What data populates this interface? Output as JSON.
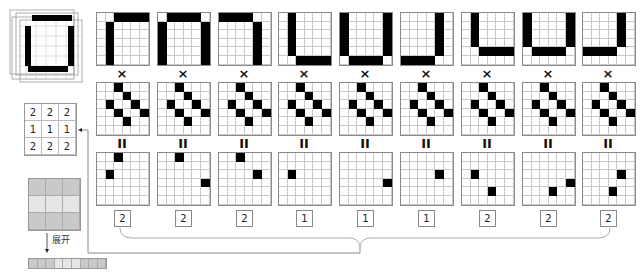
{
  "operators": {
    "multiply": "×",
    "equals": "II"
  },
  "images": [
    {
      "on": [
        [
          0,
          2
        ],
        [
          0,
          3
        ],
        [
          0,
          4
        ],
        [
          0,
          5
        ],
        [
          1,
          1
        ],
        [
          2,
          1
        ],
        [
          3,
          1
        ],
        [
          4,
          1
        ],
        [
          5,
          1
        ]
      ]
    },
    {
      "on": [
        [
          0,
          1
        ],
        [
          0,
          2
        ],
        [
          0,
          3
        ],
        [
          0,
          4
        ],
        [
          1,
          0
        ],
        [
          2,
          0
        ],
        [
          3,
          0
        ],
        [
          4,
          0
        ],
        [
          5,
          0
        ],
        [
          1,
          5
        ],
        [
          2,
          5
        ],
        [
          3,
          5
        ],
        [
          4,
          5
        ],
        [
          5,
          5
        ]
      ]
    },
    {
      "on": [
        [
          0,
          0
        ],
        [
          0,
          1
        ],
        [
          0,
          2
        ],
        [
          0,
          3
        ],
        [
          1,
          4
        ],
        [
          2,
          4
        ],
        [
          3,
          4
        ],
        [
          4,
          4
        ],
        [
          5,
          4
        ]
      ]
    },
    {
      "on": [
        [
          0,
          1
        ],
        [
          1,
          1
        ],
        [
          2,
          1
        ],
        [
          3,
          1
        ],
        [
          4,
          1
        ],
        [
          5,
          2
        ],
        [
          5,
          3
        ],
        [
          5,
          4
        ],
        [
          5,
          5
        ]
      ]
    },
    {
      "on": [
        [
          0,
          0
        ],
        [
          1,
          0
        ],
        [
          2,
          0
        ],
        [
          3,
          0
        ],
        [
          4,
          0
        ],
        [
          0,
          5
        ],
        [
          1,
          5
        ],
        [
          2,
          5
        ],
        [
          3,
          5
        ],
        [
          4,
          5
        ],
        [
          5,
          1
        ],
        [
          5,
          2
        ],
        [
          5,
          3
        ],
        [
          5,
          4
        ]
      ]
    },
    {
      "on": [
        [
          0,
          4
        ],
        [
          1,
          4
        ],
        [
          2,
          4
        ],
        [
          3,
          4
        ],
        [
          4,
          4
        ],
        [
          5,
          0
        ],
        [
          5,
          1
        ],
        [
          5,
          2
        ],
        [
          5,
          3
        ]
      ]
    },
    {
      "on": [
        [
          0,
          1
        ],
        [
          1,
          1
        ],
        [
          2,
          1
        ],
        [
          3,
          1
        ],
        [
          4,
          2
        ],
        [
          4,
          3
        ],
        [
          4,
          4
        ],
        [
          4,
          5
        ]
      ]
    },
    {
      "on": [
        [
          0,
          0
        ],
        [
          1,
          0
        ],
        [
          2,
          0
        ],
        [
          3,
          0
        ],
        [
          0,
          5
        ],
        [
          1,
          5
        ],
        [
          2,
          5
        ],
        [
          3,
          5
        ],
        [
          4,
          1
        ],
        [
          4,
          2
        ],
        [
          4,
          3
        ],
        [
          4,
          4
        ]
      ]
    },
    {
      "on": [
        [
          0,
          4
        ],
        [
          1,
          4
        ],
        [
          2,
          4
        ],
        [
          3,
          4
        ],
        [
          4,
          0
        ],
        [
          4,
          1
        ],
        [
          4,
          2
        ],
        [
          4,
          3
        ]
      ]
    }
  ],
  "kernel": {
    "on": [
      [
        0,
        2
      ],
      [
        1,
        3
      ],
      [
        2,
        1
      ],
      [
        2,
        4
      ],
      [
        3,
        2
      ],
      [
        3,
        5
      ],
      [
        4,
        3
      ]
    ]
  },
  "products": [
    {
      "on": [
        [
          0,
          2
        ],
        [
          2,
          1
        ]
      ],
      "sum": "2"
    },
    {
      "on": [
        [
          0,
          2
        ],
        [
          3,
          5
        ]
      ],
      "sum": "2"
    },
    {
      "on": [
        [
          0,
          2
        ],
        [
          2,
          4
        ]
      ],
      "sum": "2"
    },
    {
      "on": [
        [
          2,
          1
        ]
      ],
      "sum": "1"
    },
    {
      "on": [
        [
          3,
          5
        ]
      ],
      "sum": "1"
    },
    {
      "on": [
        [
          2,
          4
        ]
      ],
      "sum": "1"
    },
    {
      "on": [
        [
          2,
          1
        ],
        [
          4,
          3
        ]
      ],
      "sum": "2"
    },
    {
      "on": [
        [
          3,
          5
        ],
        [
          4,
          3
        ]
      ],
      "sum": "2"
    },
    {
      "on": [
        [
          2,
          4
        ],
        [
          4,
          3
        ]
      ],
      "sum": "2"
    }
  ],
  "output_matrix": [
    [
      "2",
      "2",
      "2"
    ],
    [
      "1",
      "1",
      "1"
    ],
    [
      "2",
      "2",
      "2"
    ]
  ],
  "gray_matrix_colors": [
    [
      "#c9c9c9",
      "#c9c9c9",
      "#c9c9c9"
    ],
    [
      "#e6e6e6",
      "#e6e6e6",
      "#e6e6e6"
    ],
    [
      "#c9c9c9",
      "#c9c9c9",
      "#c9c9c9"
    ]
  ],
  "flat_vector_colors": [
    "#c9c9c9",
    "#c9c9c9",
    "#c9c9c9",
    "#e6e6e6",
    "#e6e6e6",
    "#e6e6e6",
    "#c9c9c9",
    "#c9c9c9",
    "#c9c9c9"
  ],
  "unfold_label": "展开",
  "colors": {
    "on": "#000000",
    "grid_line": "#c8c8c8",
    "border": "#8a8a8a"
  }
}
